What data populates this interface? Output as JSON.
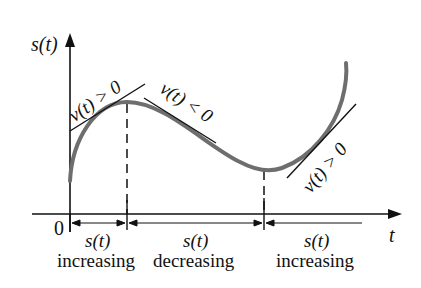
{
  "diagram": {
    "type": "function-graph",
    "y_axis_label": "s(t)",
    "x_axis_label": "t",
    "origin_label": "0",
    "tangent_labels": [
      {
        "id": "t1",
        "text": "v(t) > 0"
      },
      {
        "id": "t2",
        "text": "v(t) < 0"
      },
      {
        "id": "t3",
        "text": "v(t) > 0"
      }
    ],
    "intervals": [
      {
        "var": "s(t)",
        "state": "increasing"
      },
      {
        "var": "s(t)",
        "state": "decreasing"
      },
      {
        "var": "s(t)",
        "state": "increasing"
      }
    ],
    "colors": {
      "curve": "#6e6e6e",
      "axes": "#111111",
      "tangent": "#111111"
    }
  }
}
